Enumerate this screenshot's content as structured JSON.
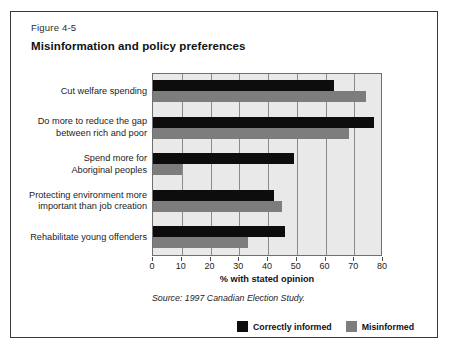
{
  "figure": {
    "number": "Figure 4-5",
    "title": "Misinformation and policy preferences",
    "source": "Source: 1997 Canadian Election Study."
  },
  "colors": {
    "correctly_informed": "#0d0d0d",
    "misinformed": "#7d7d7d",
    "plot_background": "#e9e9e9",
    "gridline": "#8a8a8a",
    "border": "#3a3a3a"
  },
  "legend": {
    "position": "bottom-right",
    "items": [
      {
        "label": "Correctly informed",
        "color": "#0d0d0d"
      },
      {
        "label": "Misinformed",
        "color": "#7d7d7d"
      }
    ]
  },
  "chart_data": {
    "type": "bar",
    "orientation": "horizontal",
    "title": "Misinformation and policy preferences",
    "xlabel": "% with stated opinion",
    "ylabel": "",
    "xlim": [
      0,
      80
    ],
    "xticks": [
      0,
      10,
      20,
      30,
      40,
      50,
      60,
      70,
      80
    ],
    "grid": true,
    "categories": [
      "Cut welfare spending",
      "Do more to reduce the gap between rich and poor",
      "Spend more for Aboriginal peoples",
      "Protecting environment more important than job creation",
      "Rehabilitate young offenders"
    ],
    "category_lines": [
      [
        "Cut welfare spending"
      ],
      [
        "Do more to reduce the gap",
        "between rich and poor"
      ],
      [
        "Spend more for",
        "Aboriginal peoples"
      ],
      [
        "Protecting environment more",
        "important than job creation"
      ],
      [
        "Rehabilitate young offenders"
      ]
    ],
    "series": [
      {
        "name": "Correctly informed",
        "color": "#0d0d0d",
        "values": [
          63,
          77,
          49,
          42,
          46
        ]
      },
      {
        "name": "Misinformed",
        "color": "#7d7d7d",
        "values": [
          74,
          68,
          10,
          45,
          33
        ]
      }
    ]
  }
}
